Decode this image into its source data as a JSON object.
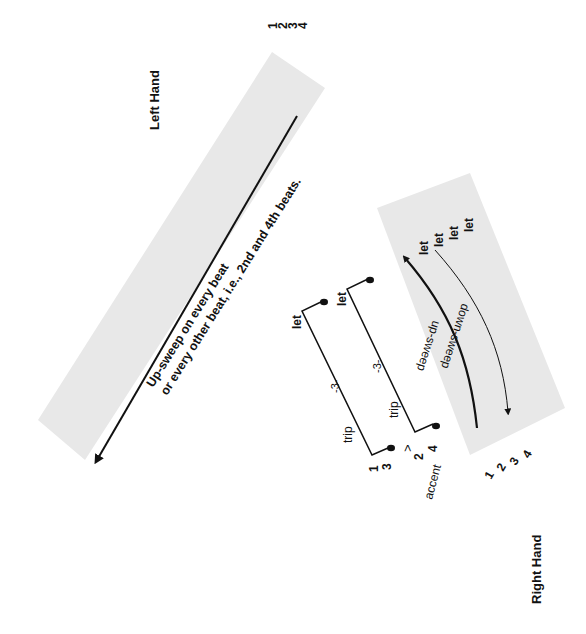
{
  "colors": {
    "band": "#e8e8e8",
    "ink": "#111111",
    "background": "#ffffff"
  },
  "left_hand": {
    "label": "Left Hand",
    "beat_numbers": [
      "1",
      "2",
      "3",
      "4"
    ],
    "instruction_line1": "Up-sweep on every beat",
    "instruction_line2": "or every other beat, i.e., 2nd and 4th beats."
  },
  "right_hand": {
    "label": "Right Hand",
    "beat_numbers": [
      "1",
      "2",
      "3",
      "4"
    ],
    "let_labels": [
      "let",
      "let",
      "let",
      "let"
    ],
    "up_sweep_label": "up-sweep",
    "down_sweep_label": "down-sweep"
  },
  "triplets": {
    "upper": {
      "numbers": [
        "1",
        "3"
      ],
      "trip_label": "trip",
      "tuplet_label": "-3-",
      "let_label": "let"
    },
    "lower": {
      "numbers": [
        "2",
        "4"
      ],
      "trip_label": "trip",
      "tuplet_label": "-3-",
      "let_label": "let",
      "accent_mark": ">",
      "accent_label": "accent"
    }
  }
}
